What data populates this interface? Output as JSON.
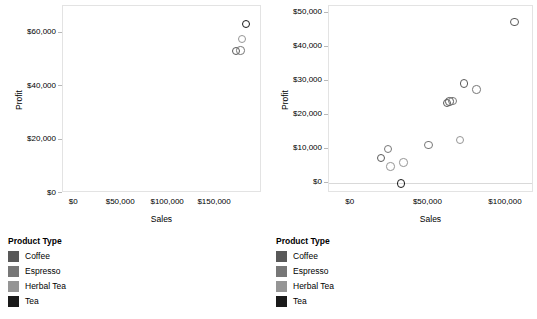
{
  "page": {
    "width": 537,
    "height": 319,
    "background": "#ffffff",
    "panel_count": 2
  },
  "legend_colors": {
    "Coffee": "#595959",
    "Espresso": "#777777",
    "Herbal Tea": "#959595",
    "Tea": "#1a1a1a"
  },
  "left": {
    "legend": {
      "title": "Product Type",
      "items": [
        {
          "label": "Coffee",
          "color": "#595959"
        },
        {
          "label": "Espresso",
          "color": "#777777"
        },
        {
          "label": "Herbal Tea",
          "color": "#959595"
        },
        {
          "label": "Tea",
          "color": "#1a1a1a"
        }
      ]
    }
  },
  "right": {
    "legend": {
      "title": "Product Type",
      "items": [
        {
          "label": "Coffee",
          "color": "#595959"
        },
        {
          "label": "Espresso",
          "color": "#777777"
        },
        {
          "label": "Herbal Tea",
          "color": "#959595"
        },
        {
          "label": "Tea",
          "color": "#1a1a1a"
        }
      ]
    }
  },
  "chart_data": [
    {
      "id": "left-scatter",
      "type": "scatter",
      "title": "",
      "xlabel": "Sales",
      "ylabel": "Profit",
      "xlim": [
        -12000,
        200000
      ],
      "ylim": [
        0,
        70000
      ],
      "xticks": [
        0,
        50000,
        100000,
        150000
      ],
      "xticklabels": [
        "$0",
        "$50,000",
        "$100,000",
        "$150,000"
      ],
      "yticks": [
        0,
        20000,
        40000,
        60000
      ],
      "yticklabels": [
        "$0",
        "$20,000",
        "$40,000",
        "$60,000"
      ],
      "grid": false,
      "legend_position": "below-left",
      "series": [
        {
          "name": "Coffee",
          "color": "#595959",
          "points": [
            {
              "x": 172000,
              "y": 53200
            }
          ]
        },
        {
          "name": "Espresso",
          "color": "#777777",
          "points": [
            {
              "x": 177000,
              "y": 53400
            }
          ]
        },
        {
          "name": "Herbal Tea",
          "color": "#959595",
          "points": [
            {
              "x": 179000,
              "y": 57600
            }
          ]
        },
        {
          "name": "Tea",
          "color": "#1a1a1a",
          "points": [
            {
              "x": 183000,
              "y": 63200
            }
          ]
        }
      ]
    },
    {
      "id": "right-scatter",
      "type": "scatter",
      "title": "",
      "xlabel": "Sales",
      "ylabel": "Profit",
      "xlim": [
        -14000,
        118000
      ],
      "ylim": [
        -3000,
        52000
      ],
      "xticks": [
        0,
        50000,
        100000
      ],
      "xticklabels": [
        "$0",
        "$50,000",
        "$100,000"
      ],
      "yticks": [
        0,
        10000,
        20000,
        30000,
        40000,
        50000
      ],
      "yticklabels": [
        "$0",
        "$10,000",
        "$20,000",
        "$30,000",
        "$40,000",
        "$50,000"
      ],
      "grid": false,
      "zero_line": true,
      "legend_position": "below-left",
      "series": [
        {
          "name": "Coffee",
          "color": "#595959",
          "points": [
            {
              "x": 19500,
              "y": 7300
            },
            {
              "x": 62000,
              "y": 23500
            },
            {
              "x": 63500,
              "y": 23900
            },
            {
              "x": 73000,
              "y": 29200
            },
            {
              "x": 105500,
              "y": 47300
            }
          ]
        },
        {
          "name": "Espresso",
          "color": "#777777",
          "points": [
            {
              "x": 24000,
              "y": 10000
            },
            {
              "x": 50000,
              "y": 11200
            },
            {
              "x": 65500,
              "y": 24100
            },
            {
              "x": 81000,
              "y": 27400
            }
          ]
        },
        {
          "name": "Herbal Tea",
          "color": "#959595",
          "points": [
            {
              "x": 25500,
              "y": 4800
            },
            {
              "x": 34000,
              "y": 6000
            },
            {
              "x": 70500,
              "y": 12600
            }
          ]
        },
        {
          "name": "Tea",
          "color": "#1a1a1a",
          "points": [
            {
              "x": 32500,
              "y": -200
            }
          ]
        }
      ]
    }
  ]
}
